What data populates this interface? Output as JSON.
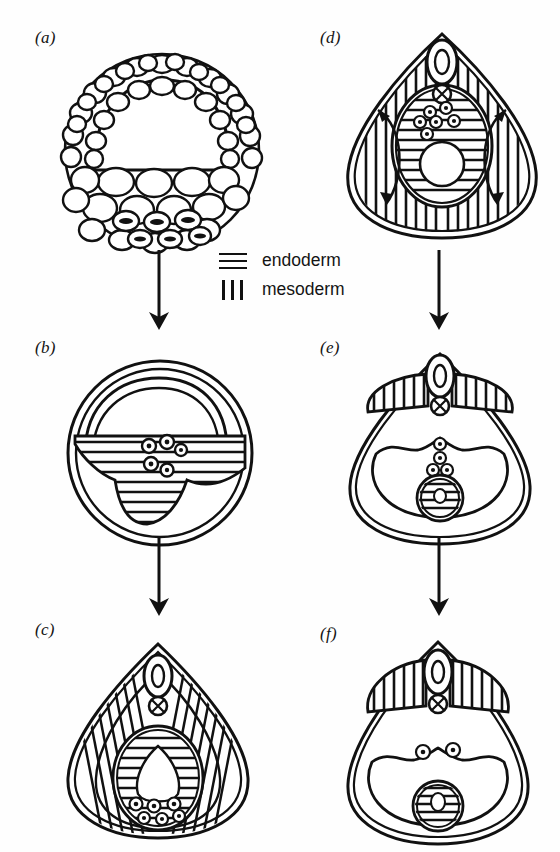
{
  "figure": {
    "kind": "scientific-diagram",
    "ink_color": "#111111",
    "background_color": "#fefefe"
  },
  "legend": {
    "items": [
      {
        "label": "endoderm",
        "pattern": "horizontal-lines",
        "swatch_lines": 3
      },
      {
        "label": "mesoderm",
        "pattern": "vertical-lines",
        "swatch_lines": 3
      }
    ]
  },
  "panels": [
    {
      "id": "a",
      "label": "(a)",
      "column": "left",
      "stage": 1,
      "shape": "circle",
      "features": [
        "outer ring of small cells",
        "large blastocoel cavity (dome) upper region",
        "field of large yolk cells lower region",
        "row of germ cells with dark granular inclusions at ventral floor"
      ],
      "germ_cell_count": 6,
      "hatching": "none"
    },
    {
      "id": "b",
      "label": "(b)",
      "column": "left",
      "stage": 2,
      "shape": "circle",
      "features": [
        "double outer wall",
        "arched archenteron roof",
        "horizontally hatched endoderm mass",
        "cluster of germ cells at endoderm margin"
      ],
      "germ_cell_count": 5,
      "hatching": "endoderm-horizontal"
    },
    {
      "id": "c",
      "label": "(c)",
      "column": "left",
      "stage": 3,
      "shape": "teardrop",
      "features": [
        "neural tube oval at apex",
        "notochord circle with cross beneath neural tube",
        "flanking mesoderm with vertical hatching",
        "central endoderm oval with horizontal hatching",
        "gut lumen inside endoderm",
        "germ cells along endoderm floor"
      ],
      "germ_cell_count": 6,
      "hatching": "mesoderm-vertical + endoderm-horizontal"
    },
    {
      "id": "d",
      "label": "(d)",
      "column": "right",
      "stage": 4,
      "shape": "teardrop",
      "features": [
        "neural tube oval at apex",
        "notochord circle with cross",
        "broad vertically hatched mesoderm filling body",
        "two curved migration arrows in mesoderm",
        "central endoderm oval with horizontal hatching",
        "gut lumen circle",
        "germ cells migrating from endoderm"
      ],
      "germ_cell_count": 6,
      "migration_arrows": 2,
      "hatching": "mesoderm-vertical + endoderm-horizontal"
    },
    {
      "id": "e",
      "label": "(e)",
      "column": "right",
      "stage": 5,
      "shape": "teardrop",
      "features": [
        "neural tube oval at apex",
        "notochord circle with cross",
        "paired wing-shaped vertically hatched mesoderm blocks",
        "large coelomic cavity with scalloped roof",
        "vertical chain of germ cells descending to gonad",
        "gonad sphere with horizontal hatching"
      ],
      "germ_cell_count": 5,
      "hatching": "mesoderm-vertical + endoderm-horizontal"
    },
    {
      "id": "f",
      "label": "(f)",
      "column": "right",
      "stage": 6,
      "shape": "teardrop",
      "features": [
        "neural tube oval at apex",
        "notochord circle with cross",
        "paired wing-shaped vertically hatched mesoderm blocks",
        "large coelomic cavity with scalloped roof",
        "two germ cells on coelomic roof",
        "gonad sphere with horizontal hatching containing germ cell"
      ],
      "germ_cell_count": 3,
      "hatching": "mesoderm-vertical + endoderm-horizontal"
    }
  ],
  "arrows": [
    {
      "id": "a-to-b",
      "from": "a",
      "to": "b",
      "direction": "down"
    },
    {
      "id": "b-to-c",
      "from": "b",
      "to": "c",
      "direction": "down"
    },
    {
      "id": "d-to-e",
      "from": "d",
      "to": "e",
      "direction": "down"
    },
    {
      "id": "e-to-f",
      "from": "e",
      "to": "f",
      "direction": "down"
    }
  ]
}
